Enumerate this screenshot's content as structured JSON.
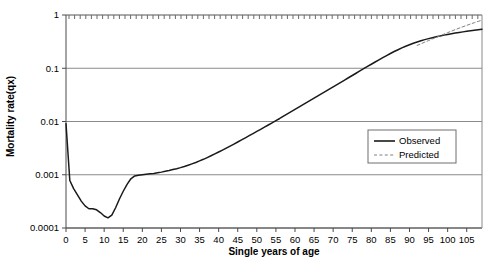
{
  "chart_data": {
    "type": "line",
    "title": "",
    "xlabel": "Single years of age",
    "ylabel": "Mortality rate(qx)",
    "yscale": "log",
    "ylim": [
      0.0001,
      1
    ],
    "xlim": [
      0,
      109
    ],
    "grid": true,
    "legend_position": "center-right",
    "y_ticks": [
      "0.0001",
      "0.001",
      "0.01",
      "0.1",
      "1"
    ],
    "y_tick_values": [
      0.0001,
      0.001,
      0.01,
      0.1,
      1
    ],
    "x_ticks": [
      "0",
      "5",
      "10",
      "15",
      "20",
      "25",
      "30",
      "35",
      "40",
      "45",
      "50",
      "55",
      "60",
      "65",
      "70",
      "75",
      "80",
      "85",
      "90",
      "95",
      "100",
      "105"
    ],
    "x_tick_values": [
      0,
      5,
      10,
      15,
      20,
      25,
      30,
      35,
      40,
      45,
      50,
      55,
      60,
      65,
      70,
      75,
      80,
      85,
      90,
      95,
      100,
      105
    ],
    "series": [
      {
        "name": "Observed",
        "style": "solid",
        "color": "#1a1a1a",
        "x": [
          0,
          1,
          2,
          3,
          4,
          5,
          6,
          7,
          8,
          9,
          10,
          11,
          12,
          13,
          14,
          15,
          16,
          17,
          18,
          19,
          20,
          21,
          22,
          23,
          24,
          25,
          26,
          27,
          28,
          29,
          30,
          31,
          32,
          33,
          34,
          35,
          36,
          37,
          38,
          39,
          40,
          41,
          42,
          43,
          44,
          45,
          46,
          47,
          48,
          49,
          50,
          51,
          52,
          53,
          54,
          55,
          56,
          57,
          58,
          59,
          60,
          61,
          62,
          63,
          64,
          65,
          66,
          67,
          68,
          69,
          70,
          71,
          72,
          73,
          74,
          75,
          76,
          77,
          78,
          79,
          80,
          81,
          82,
          83,
          84,
          85,
          86,
          87,
          88,
          89,
          90,
          91,
          92,
          93,
          94,
          95,
          96,
          97,
          98,
          99,
          100,
          101,
          102,
          103,
          104,
          105,
          106,
          107,
          108,
          109
        ],
        "y": [
          0.0091,
          0.00078,
          0.00055,
          0.00042,
          0.00032,
          0.00026,
          0.00023,
          0.00023,
          0.00022,
          0.000195,
          0.000168,
          0.000155,
          0.000175,
          0.00024,
          0.00035,
          0.00049,
          0.00066,
          0.00084,
          0.00095,
          0.00098,
          0.001,
          0.00102,
          0.00104,
          0.00106,
          0.00109,
          0.00112,
          0.00116,
          0.0012,
          0.00125,
          0.0013,
          0.00136,
          0.00143,
          0.00151,
          0.0016,
          0.0017,
          0.00182,
          0.00195,
          0.0021,
          0.00227,
          0.00246,
          0.00267,
          0.0029,
          0.00316,
          0.00345,
          0.00377,
          0.00412,
          0.00451,
          0.00494,
          0.00541,
          0.00593,
          0.0065,
          0.00713,
          0.00783,
          0.0086,
          0.00945,
          0.0104,
          0.0114,
          0.0126,
          0.0139,
          0.0153,
          0.0169,
          0.0186,
          0.0205,
          0.0226,
          0.0249,
          0.0275,
          0.0303,
          0.0334,
          0.0368,
          0.0406,
          0.0448,
          0.0494,
          0.0545,
          0.0601,
          0.0663,
          0.0731,
          0.0806,
          0.0889,
          0.098,
          0.108,
          0.119,
          0.131,
          0.144,
          0.158,
          0.173,
          0.189,
          0.206,
          0.223,
          0.241,
          0.259,
          0.277,
          0.295,
          0.312,
          0.329,
          0.345,
          0.36,
          0.375,
          0.39,
          0.405,
          0.419,
          0.432,
          0.445,
          0.458,
          0.47,
          0.482,
          0.494,
          0.506,
          0.518,
          0.53,
          0.542
        ]
      },
      {
        "name": "Predicted",
        "style": "dashed",
        "color": "#808080",
        "x": [
          92,
          93,
          94,
          95,
          96,
          97,
          98,
          99,
          100,
          101,
          102,
          103,
          104,
          105,
          106,
          107,
          108,
          109
        ],
        "y": [
          0.268,
          0.288,
          0.309,
          0.331,
          0.355,
          0.38,
          0.407,
          0.436,
          0.466,
          0.498,
          0.531,
          0.566,
          0.602,
          0.639,
          0.678,
          0.718,
          0.759,
          0.8
        ]
      }
    ]
  },
  "legend": {
    "items": [
      {
        "label": "Observed",
        "style": "solid"
      },
      {
        "label": "Predicted",
        "style": "dashed"
      }
    ]
  }
}
